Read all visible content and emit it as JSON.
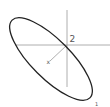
{
  "diagram": {
    "labels": {
      "axis_2": "2",
      "axis_x": "x",
      "axis_1": "1"
    },
    "colors": {
      "ellipse_stroke": "#222222",
      "axis_stroke": "#9a9a9a",
      "label": "#555555",
      "background": "#ffffff"
    },
    "ellipse": {
      "cx": 51,
      "cy": 59,
      "rx": 54,
      "ry": 20,
      "rotation_deg": 45
    },
    "axes": {
      "origin": [
        67,
        45
      ],
      "vertical": {
        "from": [
          67,
          10
        ],
        "to": [
          67,
          87
        ]
      },
      "horizontal": {
        "from": [
          15,
          45
        ],
        "to": [
          110,
          45
        ]
      },
      "diagonal": {
        "from": [
          67,
          45
        ],
        "to": [
          49,
          62
        ]
      }
    }
  }
}
